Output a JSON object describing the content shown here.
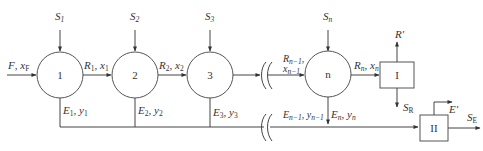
{
  "diagram": {
    "type": "multistage-crosscurrent-extraction-flowsheet",
    "colors": {
      "stroke": "#444444",
      "text": "#333333",
      "background": "#ffffff"
    },
    "feed": {
      "label": "F",
      "sub": "",
      "comp": "x",
      "comp_sub": "F"
    },
    "stages": [
      {
        "id": "1",
        "solvent": "S",
        "solvent_sub": "1",
        "raffinate": "R",
        "raffinate_sub": "1",
        "x": "x",
        "x_sub": "1",
        "extract": "E",
        "extract_sub": "1",
        "y": "y",
        "y_sub": "1"
      },
      {
        "id": "2",
        "solvent": "S",
        "solvent_sub": "2",
        "raffinate": "R",
        "raffinate_sub": "2",
        "x": "x",
        "x_sub": "2",
        "extract": "E",
        "extract_sub": "2",
        "y": "y",
        "y_sub": "2"
      },
      {
        "id": "3",
        "solvent": "S",
        "solvent_sub": "3",
        "extract": "E",
        "extract_sub": "3",
        "y": "y",
        "y_sub": "3"
      },
      {
        "id": "n",
        "solvent": "S",
        "solvent_sub": "n",
        "raffinate": "R",
        "raffinate_sub": "n",
        "x": "x",
        "x_sub": "n",
        "extract": "E",
        "extract_sub": "n",
        "y": "y",
        "y_sub": "n"
      }
    ],
    "intermediate": {
      "raffinate": "R",
      "raffinate_sub": "n−1",
      "x": "x",
      "x_sub": "n−1",
      "extract": "E",
      "extract_sub": "n−1",
      "y": "y",
      "y_sub": "n−1"
    },
    "separators": [
      {
        "id": "I",
        "top_out": "R′",
        "bottom_out": "S",
        "bottom_out_sub": "R"
      },
      {
        "id": "II",
        "top_out": "E′",
        "right_out": "S",
        "right_out_sub": "E"
      }
    ],
    "sep": ", "
  }
}
